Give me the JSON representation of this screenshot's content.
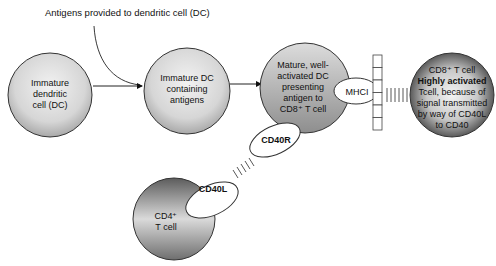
{
  "title": "Antigens provided to dendritic cell (DC)",
  "cells": {
    "immature_dc": {
      "lines": [
        "Immature",
        "dendritic",
        "cell (DC)"
      ]
    },
    "immature_dc_antigens": {
      "lines": [
        "Immature DC",
        "containing",
        "antigens"
      ]
    },
    "mature_dc": {
      "lines": [
        "Mature, well-",
        "activated DC",
        "presenting",
        "antigen to",
        "CD8⁺ T cell"
      ]
    },
    "cd8_tcell": {
      "line1": "CD8⁺ T cell",
      "line2": "Highly activated",
      "lines_rest": [
        "Tcell, because of",
        "signal transmitted",
        "by way of CD40L",
        "to CD40"
      ]
    },
    "cd4_tcell": {
      "lines": [
        "CD4⁺",
        "T cell"
      ]
    }
  },
  "molecules": {
    "mhci": "MHCI",
    "cd40r": "CD40R",
    "cd40l": "CD40L"
  },
  "colors": {
    "light_cell": "#e6e6e6",
    "mid_cell": "#a8a8a8",
    "dark_cell": "#5a5a5a",
    "stroke": "#333333"
  }
}
